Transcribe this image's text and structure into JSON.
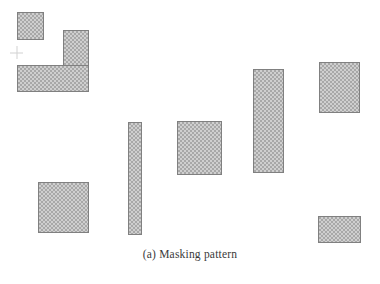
{
  "figure": {
    "caption_label": "(a)",
    "caption_text": "Masking pattern",
    "caption_full": "(a) Masking pattern",
    "background_color": "#ffffff",
    "block_border_color": "#808080",
    "block_fill_color": "#a8a8a8",
    "block_pattern_color": "#cfcfcf",
    "crosshair_color": "#d2d2d2",
    "caption_color": "#3a3a3a"
  },
  "chart_data": {
    "type": "diagram",
    "canvas": {
      "width": 380,
      "height": 250
    },
    "units": "pixels",
    "block_count": 9,
    "marker_count": 1,
    "blocks": [
      {
        "id": "block-1",
        "name": "top-left-small-square",
        "x": 17,
        "y": 12,
        "width": 27,
        "height": 28
      },
      {
        "id": "block-2",
        "name": "upper-left-vertical-bar",
        "x": 63,
        "y": 30,
        "width": 26,
        "height": 62
      },
      {
        "id": "block-3",
        "name": "upper-left-horizontal-bar",
        "x": 17,
        "y": 65,
        "width": 72,
        "height": 27
      },
      {
        "id": "block-4",
        "name": "right-upper-square",
        "x": 319,
        "y": 62,
        "width": 41,
        "height": 51
      },
      {
        "id": "block-5",
        "name": "center-tall-vertical-bar",
        "x": 253,
        "y": 69,
        "width": 31,
        "height": 104
      },
      {
        "id": "block-6",
        "name": "center-thin-vertical-bar",
        "x": 128,
        "y": 122,
        "width": 14,
        "height": 113
      },
      {
        "id": "block-7",
        "name": "center-square",
        "x": 177,
        "y": 121,
        "width": 45,
        "height": 54
      },
      {
        "id": "block-8",
        "name": "bottom-left-square",
        "x": 38,
        "y": 182,
        "width": 51,
        "height": 51
      },
      {
        "id": "block-9",
        "name": "bottom-right-rectangle",
        "x": 318,
        "y": 216,
        "width": 43,
        "height": 27
      }
    ],
    "markers": [
      {
        "id": "marker-1",
        "name": "crosshair",
        "shape": "plus",
        "x": 10,
        "y": 46,
        "width": 13,
        "height": 13
      }
    ]
  }
}
